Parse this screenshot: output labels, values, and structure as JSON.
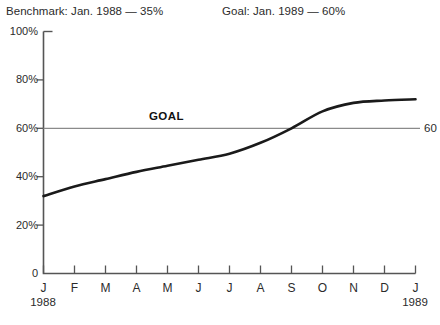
{
  "header": {
    "benchmark": "Benchmark: Jan. 1988 — 35%",
    "goal": "Goal: Jan. 1989 — 60%"
  },
  "annotations": {
    "goal_word": "GOAL",
    "goal_value": "60"
  },
  "chart_data": {
    "type": "line",
    "title": "",
    "subtitle": "",
    "xlabel": "",
    "ylabel": "",
    "categories": [
      "J",
      "F",
      "M",
      "A",
      "M",
      "J",
      "J",
      "A",
      "S",
      "O",
      "N",
      "D",
      "J"
    ],
    "x_tick_labels": [
      "J",
      "F",
      "M",
      "A",
      "M",
      "J",
      "J",
      "A",
      "S",
      "O",
      "N",
      "D",
      "J"
    ],
    "x_year_start": "1988",
    "x_year_end": "1989",
    "y_tick_labels": [
      "100%",
      "80%",
      "60%",
      "40%",
      "20%",
      "0"
    ],
    "y_ticks": [
      100,
      80,
      60,
      40,
      20,
      0
    ],
    "ylim": [
      0,
      100
    ],
    "grid": false,
    "legend": "none",
    "series": [
      {
        "name": "Progress",
        "values": [
          32,
          36,
          39,
          42,
          44.5,
          47,
          49.5,
          54,
          60,
          67,
          70.5,
          71.5,
          72
        ],
        "color": "#1a1a1a"
      }
    ],
    "reference_line": {
      "label": "GOAL",
      "value": 60,
      "value_label": "60",
      "color": "#808080"
    }
  },
  "colors": {
    "axis": "#555555",
    "line": "#1a1a1a",
    "goal_line": "#8a8a8a",
    "text": "#2b2b2b",
    "background": "#ffffff"
  }
}
